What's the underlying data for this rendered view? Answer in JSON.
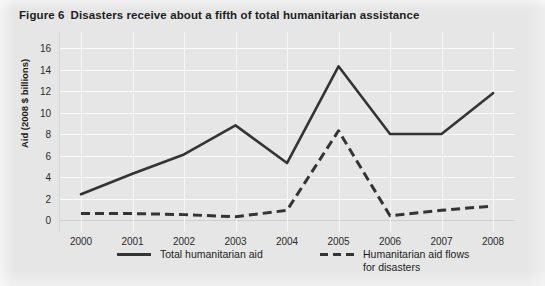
{
  "figure": {
    "number_label": "Figure 6",
    "title": "Disasters receive about a fifth of total humanitarian assistance"
  },
  "axes": {
    "ylabel": "Aid (2008 $ billions)",
    "yticks": [
      "0",
      "2",
      "4",
      "6",
      "8",
      "10",
      "12",
      "14",
      "16"
    ],
    "xticks": [
      "2000",
      "2001",
      "2002",
      "2003",
      "2004",
      "2005",
      "2006",
      "2007",
      "2008"
    ]
  },
  "legend": {
    "solid_label": "Total humanitarian aid",
    "dashed_label": "Humanitarian aid flows\nfor disasters"
  },
  "colors": {
    "background": "#e6e6e6",
    "line": "#343434",
    "gridline": "#fbfbfb",
    "text": "#1d1d1d"
  },
  "chart_data": {
    "type": "line",
    "title": "Disasters receive about a fifth of total humanitarian assistance",
    "xlabel": "",
    "ylabel": "Aid (2008 $ billions)",
    "categories": [
      "2000",
      "2001",
      "2002",
      "2003",
      "2004",
      "2005",
      "2006",
      "2007",
      "2008"
    ],
    "x": [
      2000,
      2001,
      2002,
      2003,
      2004,
      2005,
      2006,
      2007,
      2008
    ],
    "ylim": [
      0,
      16
    ],
    "ytick_step": 2,
    "grid": true,
    "legend_position": "bottom",
    "series": [
      {
        "name": "Total humanitarian aid",
        "style": "solid",
        "values": [
          2.4,
          4.3,
          6.1,
          8.8,
          5.3,
          14.3,
          8.0,
          8.0,
          11.8
        ]
      },
      {
        "name": "Humanitarian aid flows for disasters",
        "style": "dashed",
        "values": [
          0.6,
          0.6,
          0.5,
          0.3,
          0.9,
          8.3,
          0.4,
          0.9,
          1.3
        ]
      }
    ]
  }
}
